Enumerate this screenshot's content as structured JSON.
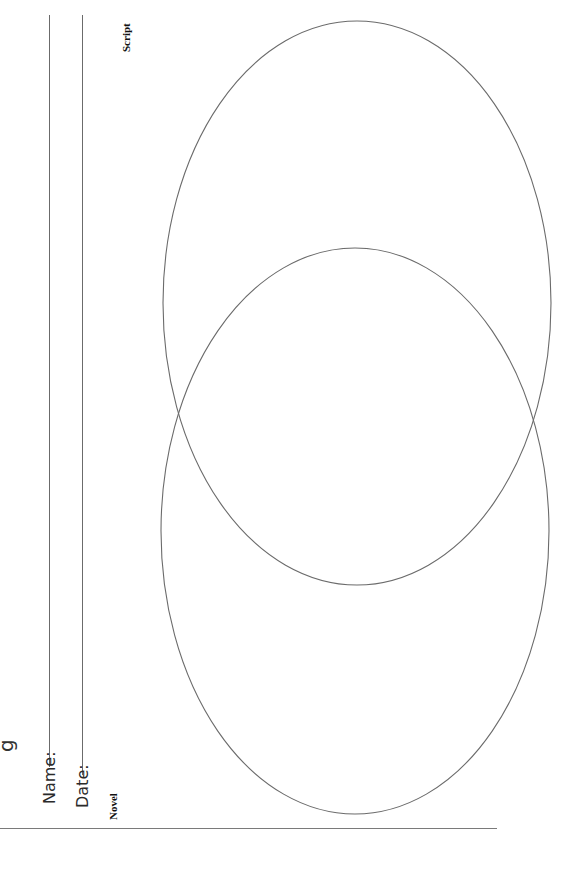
{
  "worksheet": {
    "title_partial": "g",
    "name_label": "Name:",
    "date_label": "Date:",
    "circles": [
      {
        "label": "Script",
        "cx": 357,
        "cy": 303,
        "rx": 194,
        "ry": 282
      },
      {
        "label": "Novel",
        "cx": 355,
        "cy": 531,
        "rx": 194,
        "ry": 283
      }
    ],
    "line_color": "#6b6b6b"
  }
}
